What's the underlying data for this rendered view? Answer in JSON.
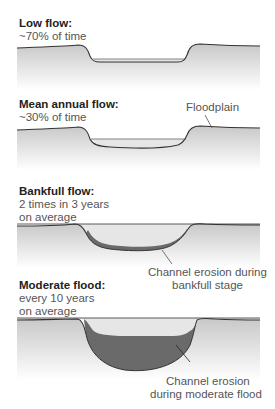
{
  "panels": [
    {
      "title": "Low flow:",
      "subtitle_lines": [
        "~70% of time"
      ]
    },
    {
      "title": "Mean annual flow:",
      "subtitle_lines": [
        "~30% of time"
      ],
      "callout": "Floodplain"
    },
    {
      "title": "Bankfull flow:",
      "subtitle_lines": [
        "2 times in 3 years",
        "on average"
      ],
      "callout_lines": [
        "Channel erosion during",
        "bankfull stage"
      ]
    },
    {
      "title": "Moderate flood:",
      "subtitle_lines": [
        "every 10 years",
        "on average"
      ],
      "callout_lines": [
        "Channel erosion",
        "during moderate flood"
      ]
    }
  ],
  "colors": {
    "ground_top": "#cfcfcf",
    "ground_bottom": "#ffffff",
    "water": "#e4e4e4",
    "erosion": "#6a6a6a",
    "outline": "#333333"
  }
}
